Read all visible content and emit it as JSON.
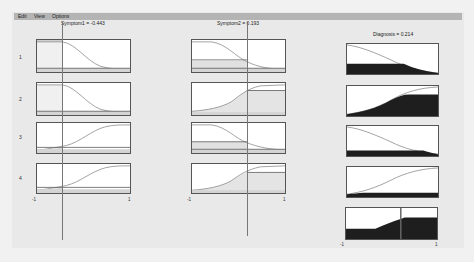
{
  "menu": {
    "items": [
      {
        "label": "Edit"
      },
      {
        "label": "View"
      },
      {
        "label": "Options"
      }
    ]
  },
  "inputs": [
    {
      "title": "Symptom1 = -0.443",
      "value": -0.443,
      "axis_min": "-1",
      "axis_max": "1"
    },
    {
      "title": "Symptom2 = 0.193",
      "value": 0.193,
      "axis_min": "-1",
      "axis_max": "1"
    }
  ],
  "output": {
    "title": "Diagnosis = 0.214",
    "value": 0.214,
    "axis_min": "-1",
    "axis_max": "1"
  },
  "rules": [
    {
      "label": "1"
    },
    {
      "label": "2"
    },
    {
      "label": "3"
    },
    {
      "label": "4"
    }
  ],
  "colors": {
    "menubar": "#b4b4b4",
    "fill_output": "#1e1e1e",
    "fill_input": "#cfcfcf",
    "curve": "#888888",
    "border": "#555555"
  }
}
